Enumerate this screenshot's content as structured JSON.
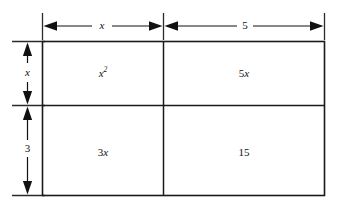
{
  "figure": {
    "type": "area-model-rectangle-diagram",
    "background_color": "#ffffff",
    "line_color": "#1a1a1a",
    "text_color": "#111111"
  },
  "dimensions": {
    "top": [
      {
        "id": "width-x",
        "label": "x",
        "italic": true
      },
      {
        "id": "width-5",
        "label": "5",
        "italic": false
      }
    ],
    "left": [
      {
        "id": "height-x",
        "label": "x",
        "italic": true
      },
      {
        "id": "height-3",
        "label": "3",
        "italic": false
      }
    ]
  },
  "cells": [
    {
      "id": "cell-top-left",
      "base": "x",
      "exponent": "2",
      "italic": true,
      "row": 0,
      "col": 0
    },
    {
      "id": "cell-top-right",
      "coefficient": "5",
      "variable": "x",
      "row": 0,
      "col": 1
    },
    {
      "id": "cell-bottom-left",
      "coefficient": "3",
      "variable": "x",
      "row": 1,
      "col": 0
    },
    {
      "id": "cell-bottom-right",
      "value": "15",
      "row": 1,
      "col": 1
    }
  ]
}
